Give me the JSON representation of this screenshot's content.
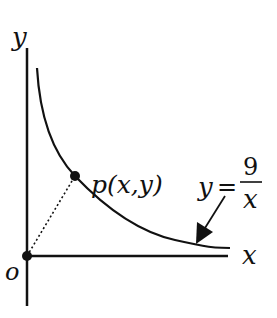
{
  "diagram": {
    "axes": {
      "x_label": "x",
      "y_label": "y",
      "origin_label": "o"
    },
    "point": {
      "label": "p(x,y)"
    },
    "curve": {
      "equation_lhs": "y",
      "equation_eq": "=",
      "numerator": "9",
      "denominator": "x"
    },
    "colors": {
      "ink": "#111111",
      "background": "#ffffff"
    }
  }
}
